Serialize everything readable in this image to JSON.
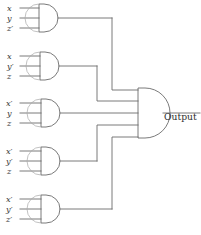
{
  "diagram": {
    "output": {
      "label": "Output",
      "gate_type": "or-gate"
    },
    "gates": [
      {
        "id": "gate-1",
        "type": "and-gate",
        "inputs": [
          {
            "var": "x",
            "primed": false,
            "text": "x"
          },
          {
            "var": "y",
            "primed": false,
            "text": "y"
          },
          {
            "var": "z",
            "primed": true,
            "text": "z′"
          }
        ]
      },
      {
        "id": "gate-2",
        "type": "and-gate",
        "inputs": [
          {
            "var": "x",
            "primed": false,
            "text": "x"
          },
          {
            "var": "y",
            "primed": true,
            "text": "y′"
          },
          {
            "var": "z",
            "primed": false,
            "text": "z"
          }
        ]
      },
      {
        "id": "gate-3",
        "type": "and-gate",
        "inputs": [
          {
            "var": "x",
            "primed": true,
            "text": "x′"
          },
          {
            "var": "y",
            "primed": false,
            "text": "y"
          },
          {
            "var": "z",
            "primed": false,
            "text": "z"
          }
        ]
      },
      {
        "id": "gate-4",
        "type": "and-gate",
        "inputs": [
          {
            "var": "x",
            "primed": true,
            "text": "x′"
          },
          {
            "var": "y",
            "primed": true,
            "text": "y′"
          },
          {
            "var": "z",
            "primed": false,
            "text": "z"
          }
        ]
      },
      {
        "id": "gate-5",
        "type": "and-gate",
        "inputs": [
          {
            "var": "x",
            "primed": true,
            "text": "x′"
          },
          {
            "var": "y",
            "primed": true,
            "text": "y′"
          },
          {
            "var": "z",
            "primed": true,
            "text": "z′"
          }
        ]
      }
    ],
    "colors": {
      "background": "#ffffff",
      "wire": "#6b6b6b",
      "gate_outline": "#6b6b6b",
      "text": "#3a3a3a"
    }
  }
}
